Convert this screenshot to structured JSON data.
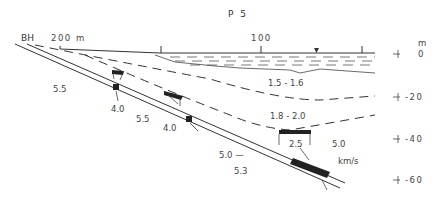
{
  "title": "P 5",
  "borehole_label": "BH",
  "distance_axis": {
    "ticks": [
      {
        "label": "200 m",
        "x": 60
      },
      {
        "label": "100",
        "x": 261
      }
    ]
  },
  "depth_axis": {
    "unit": "m",
    "ticks": [
      {
        "label": "0",
        "y": 54
      },
      {
        "label": "-20",
        "y": 97
      },
      {
        "label": "-40",
        "y": 139
      },
      {
        "label": "-60",
        "y": 180
      }
    ]
  },
  "velocity_unit": "km/s",
  "velocity_labels": [
    {
      "id": "v-left-upper",
      "text": "5.5"
    },
    {
      "id": "v-water-zone",
      "text": "1.5 - 1.6"
    },
    {
      "id": "v-fracture-1",
      "text": "4.0"
    },
    {
      "id": "v-mid",
      "text": "5.5"
    },
    {
      "id": "v-fracture-2",
      "text": "4.0"
    },
    {
      "id": "v-layer-2",
      "text": "1.8 - 2.0"
    },
    {
      "id": "v-fracture-3",
      "text": "2.5"
    },
    {
      "id": "v-right",
      "text": "5.0"
    },
    {
      "id": "v-lower-a",
      "text": "5.0 —"
    },
    {
      "id": "v-lower-b",
      "text": "5.3"
    }
  ],
  "colors": {
    "line": "#333333",
    "background": "#ffffff"
  }
}
